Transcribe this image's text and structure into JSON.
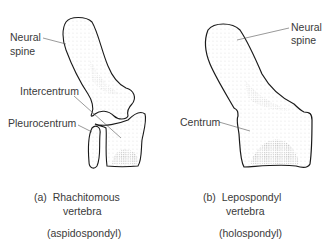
{
  "diagram": {
    "panels": [
      {
        "id": "a",
        "caption_prefix": "(a)",
        "caption_line1": "Rhachitomous",
        "caption_line2": "vertebra",
        "subtype": "(aspidospondyl)",
        "labels": {
          "neural_spine_1": "Neural",
          "neural_spine_2": "spine",
          "intercentrum": "Intercentrum",
          "pleurocentrum": "Pleurocentrum"
        }
      },
      {
        "id": "b",
        "caption_prefix": "(b)",
        "caption_line1": "Lepospondyl",
        "caption_line2": "vertebra",
        "subtype": "(holospondyl)",
        "labels": {
          "neural_spine_1": "Neural",
          "neural_spine_2": "spine",
          "centrum": "Centrum"
        }
      }
    ],
    "colors": {
      "outline": "#1a1a1a",
      "stipple": "#777777",
      "text": "#3a3a3a",
      "background": "#ffffff"
    }
  }
}
